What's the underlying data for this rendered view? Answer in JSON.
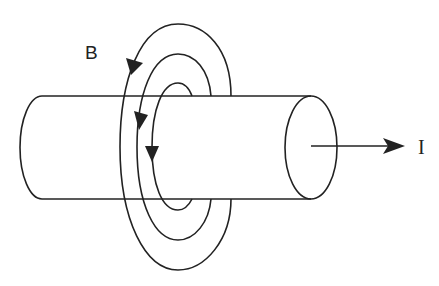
{
  "diagram": {
    "type": "magnetic field around a current-carrying wire",
    "labels": {
      "field": "B",
      "current": "I"
    },
    "elements": [
      {
        "name": "conductor-cylinder",
        "description": "horizontal cylinder (wire)"
      },
      {
        "name": "field-loops",
        "count": 3,
        "direction": "counter-clockwise arrows pointing down on near side"
      },
      {
        "name": "current-arrow",
        "direction": "right"
      }
    ],
    "colors": {
      "stroke": "#222222",
      "background": "#ffffff"
    }
  }
}
